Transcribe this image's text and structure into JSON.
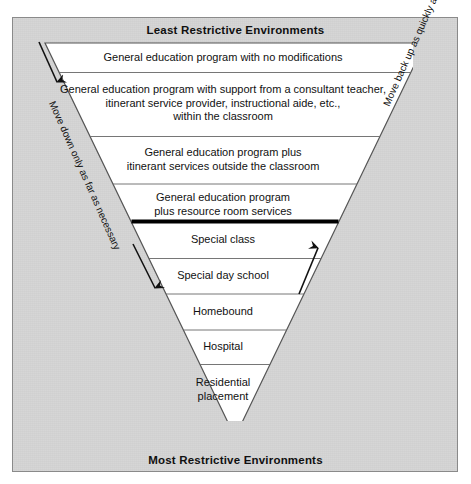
{
  "diagram": {
    "top_caption": "Least Restrictive Environments",
    "bottom_caption": "Most Restrictive Environments",
    "left_note": "Move down only as far as necessary",
    "right_note": "Move back up as quickly as possible",
    "divider_note": "thick black rule between resource room services and special class",
    "bands": [
      {
        "id": "band-1",
        "label": "General education program with no modifications"
      },
      {
        "id": "band-2",
        "label": "General education program with support from a consultant teacher,\nitinerant service provider, instructional aide, etc.,\nwithin the classroom"
      },
      {
        "id": "band-3",
        "label": "General education program plus\nitinerant services outside the classroom"
      },
      {
        "id": "band-4",
        "label": "General education program\nplus resource room services"
      },
      {
        "id": "band-5",
        "label": "Special class"
      },
      {
        "id": "band-6",
        "label": "Special day school"
      },
      {
        "id": "band-7",
        "label": "Homebound"
      },
      {
        "id": "band-8",
        "label": "Hospital"
      },
      {
        "id": "band-9",
        "label": "Residential\nplacement"
      }
    ],
    "colors": {
      "panel_background": "#d4d4d4",
      "panel_border": "#8a8a8a",
      "triangle_fill": "#ffffff",
      "triangle_stroke": "#555555",
      "divider_rule": "#000000",
      "text": "#111111"
    },
    "arrows": {
      "left_upper": "down-arrow",
      "left_lower": "down-arrow",
      "right_upper": "up-arrow",
      "right_lower": "up-arrow"
    }
  }
}
